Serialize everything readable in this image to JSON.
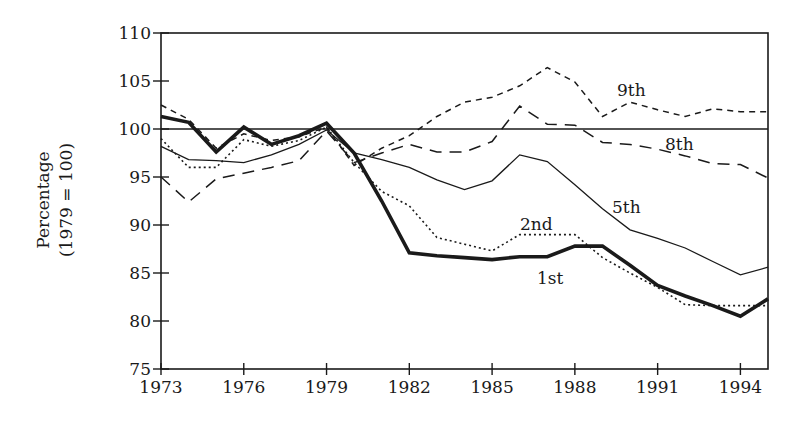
{
  "chart_data": {
    "type": "line",
    "title": "",
    "xlabel": "",
    "ylabel": "Percentage",
    "ylabel_sub": "(1979 = 100)",
    "xlim": [
      1973,
      1995
    ],
    "ylim": [
      75,
      110
    ],
    "x_ticks": [
      1973,
      1976,
      1979,
      1982,
      1985,
      1988,
      1991,
      1994
    ],
    "x_tick_labels": [
      "1973",
      "1976",
      "1979",
      "1982",
      "1985",
      "1988",
      "1991",
      "1994"
    ],
    "y_ticks": [
      75,
      80,
      85,
      90,
      95,
      100,
      105,
      110
    ],
    "y_tick_labels": [
      "75",
      "80",
      "85",
      "90",
      "95",
      "100",
      "105",
      "110"
    ],
    "grid": false,
    "legend": "inline labels",
    "reference_line": 100,
    "x": [
      1973,
      1974,
      1975,
      1976,
      1977,
      1978,
      1979,
      1980,
      1981,
      1982,
      1983,
      1984,
      1985,
      1986,
      1987,
      1988,
      1989,
      1990,
      1991,
      1992,
      1993,
      1994,
      1995
    ],
    "series": [
      {
        "name": "1st",
        "style": "thick-solid",
        "values": [
          101.3,
          100.7,
          97.6,
          100.2,
          98.4,
          99.3,
          100.6,
          97.5,
          92.5,
          87.1,
          86.8,
          86.6,
          86.4,
          86.7,
          86.7,
          87.8,
          87.8,
          85.8,
          83.7,
          82.6,
          81.6,
          80.5,
          82.3
        ],
        "label_pos": [
          537,
          284
        ]
      },
      {
        "name": "2nd",
        "style": "dotted",
        "values": [
          99.0,
          96.0,
          96.0,
          98.9,
          98.2,
          98.8,
          100.2,
          96.5,
          93.5,
          92.0,
          88.7,
          88.0,
          87.3,
          89.0,
          89.0,
          89.0,
          86.6,
          85.0,
          83.5,
          81.7,
          81.6,
          81.6,
          81.6
        ],
        "label_pos": [
          520,
          230
        ]
      },
      {
        "name": "5th",
        "style": "thin-solid",
        "values": [
          98.2,
          96.8,
          96.7,
          96.5,
          97.3,
          98.4,
          99.9,
          97.5,
          96.8,
          96.0,
          94.7,
          93.7,
          94.6,
          97.3,
          96.6,
          94.2,
          91.7,
          89.5,
          88.6,
          87.6,
          86.2,
          84.8,
          85.6
        ],
        "label_pos": [
          612,
          213
        ]
      },
      {
        "name": "8th",
        "style": "long-dash",
        "values": [
          95.0,
          92.4,
          94.8,
          95.4,
          96.0,
          96.7,
          99.8,
          96.5,
          97.5,
          98.4,
          97.6,
          97.6,
          98.7,
          102.4,
          100.5,
          100.4,
          98.6,
          98.4,
          97.9,
          97.2,
          96.4,
          96.3,
          94.9
        ],
        "label_pos": [
          665,
          150
        ]
      },
      {
        "name": "9th",
        "style": "short-dash",
        "values": [
          102.5,
          101.0,
          98.0,
          99.5,
          98.8,
          99.2,
          100.2,
          96.2,
          98.0,
          99.3,
          101.3,
          102.8,
          103.3,
          104.5,
          106.4,
          104.9,
          101.3,
          102.8,
          102.0,
          101.3,
          102.1,
          101.8,
          101.8
        ],
        "label_pos": [
          617,
          96
        ]
      }
    ]
  },
  "colors": {
    "ink": "#1a1a1a",
    "background": "#ffffff"
  }
}
